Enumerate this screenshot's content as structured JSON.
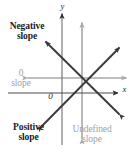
{
  "figure": {
    "type": "coordinate-plane-slope-diagram",
    "background_color": "#ffffff",
    "axis_color": "#2b2b2b",
    "dark_line_color": "#3a3a3a",
    "gray_line_color": "#a8a8a8",
    "bold_text_color": "#1a1a1a",
    "gray_text_color": "#a0a0a0"
  },
  "axes": {
    "x_label": "x",
    "y_label": "y",
    "origin_label": "0",
    "origin_point": {
      "x": 82,
      "y": 78
    },
    "x_axis_y": 93,
    "y_axis_x": 62
  },
  "labels": {
    "negative_slope": {
      "line1": "Negative",
      "line2": "slope",
      "style": "bold"
    },
    "positive_slope": {
      "line1": "Positive",
      "line2": "slope",
      "style": "bold"
    },
    "zero_slope": {
      "line1": "0",
      "line2": "slope",
      "style": "gray"
    },
    "undefined_slope": {
      "line1": "Undefined",
      "line2": "slope",
      "style": "gray"
    }
  },
  "lines": [
    {
      "name": "negative-slope-line",
      "color": "#3a3a3a",
      "from": {
        "x": 120,
        "y": 115
      },
      "to": {
        "x": 45,
        "y": 41
      },
      "arrows": "both"
    },
    {
      "name": "positive-slope-line",
      "color": "#3a3a3a",
      "from": {
        "x": 41,
        "y": 127
      },
      "to": {
        "x": 120,
        "y": 47
      },
      "arrows": "both"
    },
    {
      "name": "zero-slope-line",
      "color": "#a8a8a8",
      "from": {
        "x": 27,
        "y": 78
      },
      "to": {
        "x": 127,
        "y": 78
      },
      "arrows": "both"
    },
    {
      "name": "undefined-slope-line",
      "color": "#a8a8a8",
      "from": {
        "x": 82,
        "y": 139
      },
      "to": {
        "x": 82,
        "y": 22
      },
      "arrows": "both"
    }
  ]
}
